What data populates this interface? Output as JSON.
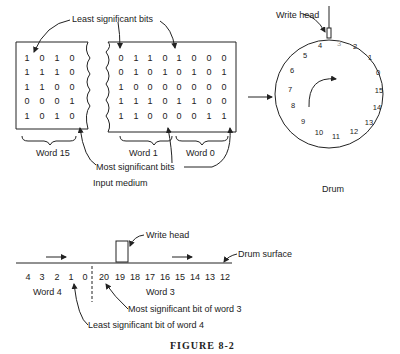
{
  "input_medium": {
    "label": "Input medium",
    "left_block": {
      "word_label": "Word 15",
      "rows": [
        [
          "1",
          "0",
          "1",
          "0"
        ],
        [
          "1",
          "1",
          "1",
          "0"
        ],
        [
          "1",
          "1",
          "0",
          "0"
        ],
        [
          "0",
          "0",
          "0",
          "1"
        ],
        [
          "1",
          "0",
          "1",
          "0"
        ]
      ]
    },
    "right_block": {
      "word_labels": [
        "Word 1",
        "Word 0"
      ],
      "rows": [
        [
          "0",
          "1",
          "1",
          "0",
          "1",
          "0",
          "0",
          "0"
        ],
        [
          "0",
          "1",
          "0",
          "1",
          "0",
          "1",
          "0",
          "1"
        ],
        [
          "1",
          "0",
          "0",
          "0",
          "0",
          "0",
          "0",
          "0"
        ],
        [
          "1",
          "1",
          "1",
          "0",
          "1",
          "1",
          "0",
          "0"
        ],
        [
          "1",
          "1",
          "0",
          "0",
          "0",
          "0",
          "1",
          "1"
        ]
      ]
    },
    "annotations": {
      "least_significant": "Least significant bits",
      "most_significant": "Most significant bits"
    }
  },
  "drum": {
    "label": "Drum",
    "write_head_label": "Write head",
    "positions": [
      "3",
      "2",
      "1",
      "0",
      "15",
      "14",
      "13",
      "12",
      "11",
      "10",
      "9",
      "8",
      "7",
      "6",
      "5",
      "4"
    ]
  },
  "drum_surface": {
    "write_head_label": "Write head",
    "surface_label": "Drum surface",
    "bits": [
      "4",
      "3",
      "2",
      "1",
      "0",
      "20",
      "19",
      "18",
      "17",
      "16",
      "15",
      "14",
      "13",
      "12"
    ],
    "word_labels": [
      "Word 4",
      "Word 3"
    ],
    "annotations": {
      "msb_word3": "Most significant bit of word 3",
      "lsb_word4": "Least significant bit of word 4"
    }
  },
  "figure_caption": "FIGURE 8-2"
}
